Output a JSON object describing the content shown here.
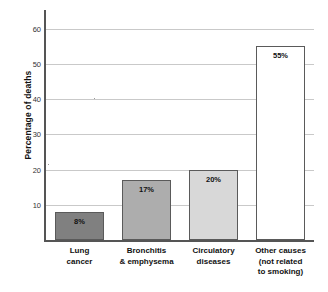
{
  "chart_data": {
    "type": "bar",
    "title": "",
    "xlabel": "",
    "ylabel": "Percentage of deaths",
    "ylim": [
      0,
      63
    ],
    "yticks": [
      10,
      20,
      30,
      40,
      50,
      60
    ],
    "ytick_labels": [
      "10",
      "20",
      "30",
      "40",
      "50",
      "60"
    ],
    "grid": true,
    "legend": "none",
    "categories": [
      "Lung cancer",
      "Bronchitis & emphysema",
      "Circulatory diseases",
      "Other causes (not related to smoking)"
    ],
    "category_lines": [
      [
        "Lung",
        "cancer"
      ],
      [
        "Bronchitis",
        "& emphysema"
      ],
      [
        "Circulatory",
        "diseases"
      ],
      [
        "Other causes",
        "(not related",
        "to smoking)"
      ]
    ],
    "values": [
      8,
      17,
      20,
      55
    ],
    "value_labels": [
      "8%",
      "17%",
      "20%",
      "55%"
    ],
    "bar_colors": [
      "#808080",
      "#adadad",
      "#d8d8d8",
      "#ffffff"
    ],
    "bar_edge_color": "#5a5a5a",
    "axis_color": "#555555",
    "gridline_color": "#c9c9c9"
  }
}
